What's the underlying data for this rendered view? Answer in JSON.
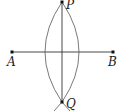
{
  "diagram": {
    "type": "perpendicular-bisector-construction",
    "points": {
      "A": {
        "label": "A",
        "x": 12,
        "y": 52
      },
      "B": {
        "label": "B",
        "x": 113,
        "y": 52
      },
      "P": {
        "label": "P",
        "x": 62,
        "y": 2
      },
      "Q": {
        "label": "Q",
        "x": 62,
        "y": 102
      }
    },
    "colors": {
      "stroke": "#333333",
      "point": "#111111"
    }
  }
}
